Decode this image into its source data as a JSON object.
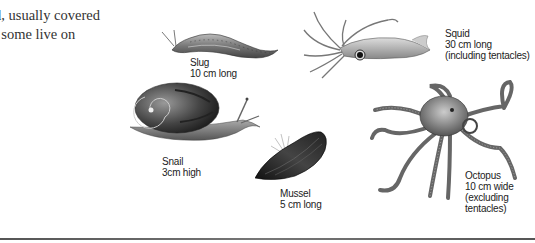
{
  "body_text": {
    "lines": [
      "d, usually covered",
      ", some live on"
    ]
  },
  "figures": {
    "slug": {
      "name": "Slug",
      "size": "10 cm long"
    },
    "squid": {
      "name": "Squid",
      "size": "30 cm long",
      "note": "(including tentacles)"
    },
    "snail": {
      "name": "Snail",
      "size": "3cm high"
    },
    "mussel": {
      "name": "Mussel",
      "size": "5 cm long"
    },
    "octopus": {
      "name": "Octopus",
      "size": "10 cm wide",
      "note1": "(excluding",
      "note2": "tentacles)"
    }
  },
  "colors": {
    "text": "#222222",
    "illustration": "#4a4a4a",
    "rule": "#666666"
  }
}
